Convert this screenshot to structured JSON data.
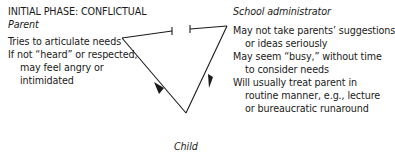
{
  "diagram": {
    "phase_title": "INITIAL PHASE: CONFLICTUAL",
    "parent": {
      "heading": "Parent",
      "lines": [
        {
          "text": "Tries to articulate needs",
          "indent": false
        },
        {
          "text": "If not “heard” or respected,",
          "indent": false
        },
        {
          "text": "may feel angry or",
          "indent": true
        },
        {
          "text": "intimidated",
          "indent": true
        }
      ]
    },
    "administrator": {
      "heading": "School administrator",
      "lines": [
        {
          "text": "May not take parents’ suggestions",
          "indent": false
        },
        {
          "text": "or ideas seriously",
          "indent": true
        },
        {
          "text": "May seem “busy,” without time",
          "indent": false
        },
        {
          "text": "to consider needs",
          "indent": true
        },
        {
          "text": "Will usually treat parent in",
          "indent": false
        },
        {
          "text": "routine manner, e.g., lecture",
          "indent": true
        },
        {
          "text": "or bureaucratic runaround",
          "indent": true
        }
      ]
    },
    "child": {
      "label": "Child"
    },
    "connections": [
      {
        "from": "Parent",
        "to": "School administrator",
        "style": "blocked (bar ends, gap)"
      },
      {
        "from": "Child",
        "to": "Parent",
        "style": "arrow"
      },
      {
        "from": "School administrator",
        "to": "Child",
        "style": "arrow"
      }
    ]
  }
}
